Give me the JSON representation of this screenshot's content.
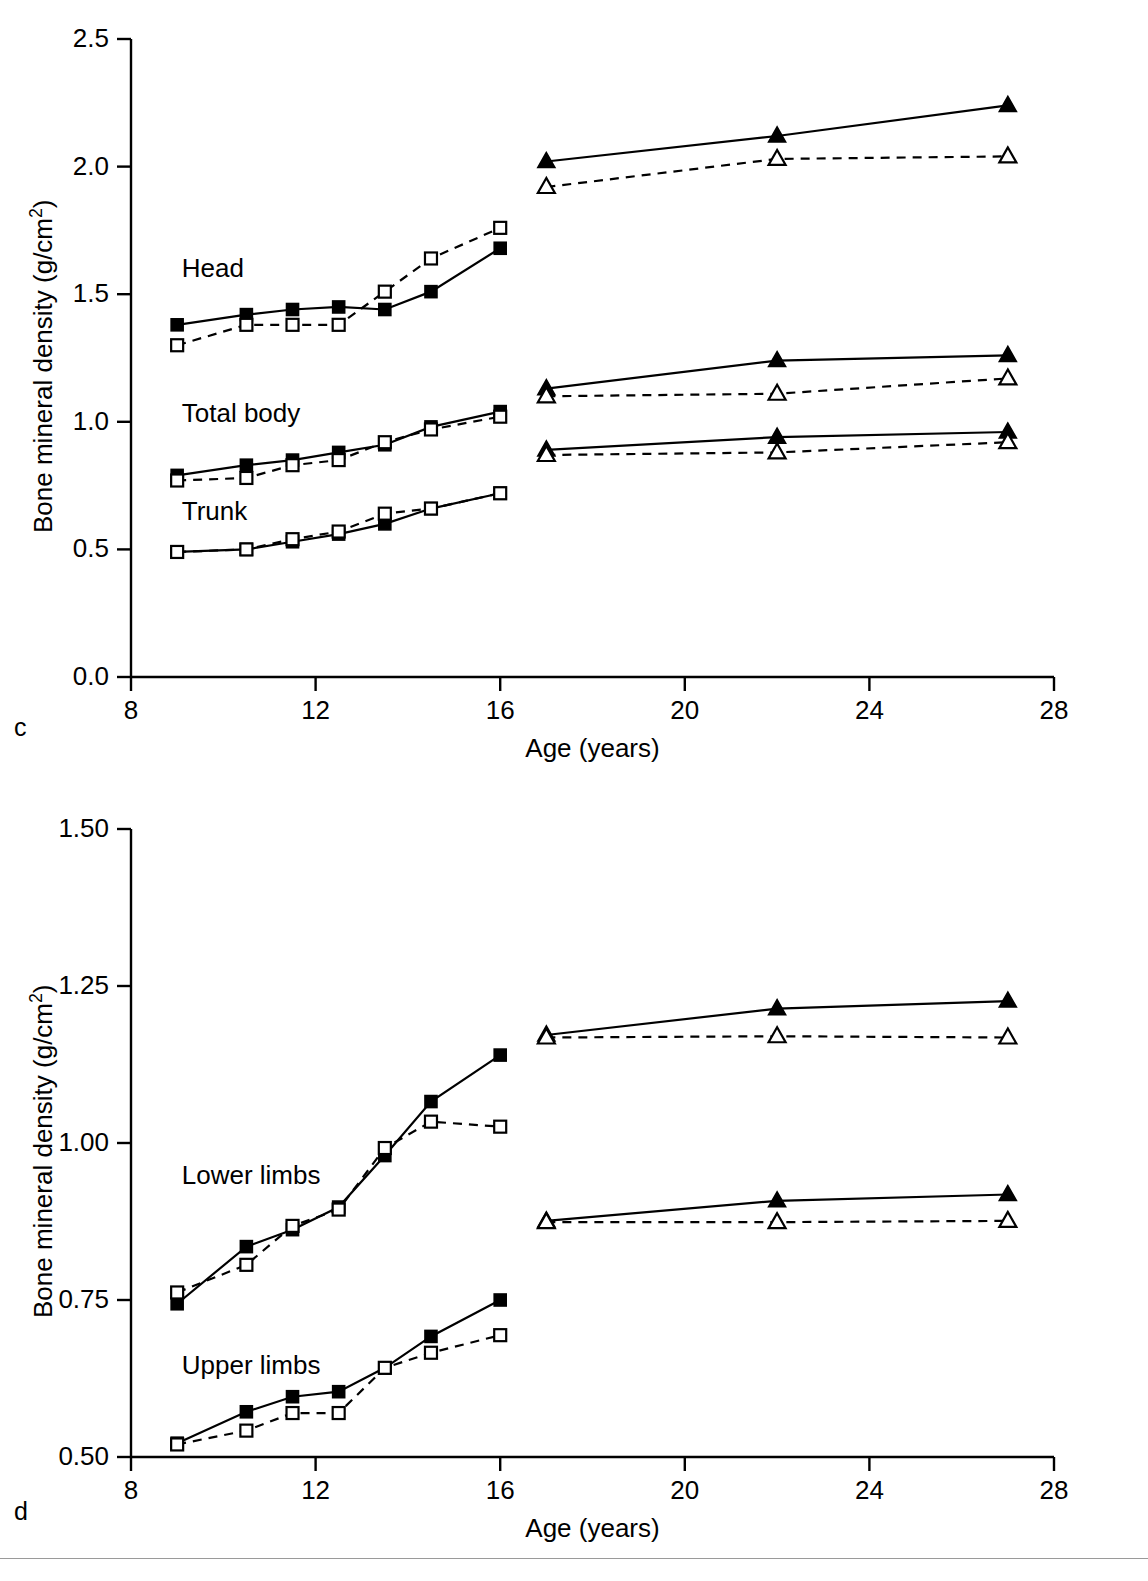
{
  "figure": {
    "panels": [
      {
        "letter": "c"
      },
      {
        "letter": "d"
      }
    ],
    "footer_note": ""
  },
  "panel_c": {
    "letter": "c",
    "xlabel": "Age (years)",
    "ylabel_part1": "Bone mineral density (g/cm",
    "ylabel_sup": "2",
    "ylabel_part3": ")",
    "x_ticks": [
      "8",
      "12",
      "16",
      "20",
      "24",
      "28"
    ],
    "y_ticks": [
      "0.0",
      "0.5",
      "1.0",
      "1.5",
      "2.0",
      "2.5"
    ],
    "series_labels": [
      "Head",
      "Total body",
      "Trunk"
    ]
  },
  "panel_d": {
    "letter": "d",
    "xlabel": "Age (years)",
    "ylabel_part1": "Bone mineral density (g/cm",
    "ylabel_sup": "2",
    "ylabel_part3": ")",
    "x_ticks": [
      "8",
      "12",
      "16",
      "20",
      "24",
      "28"
    ],
    "y_ticks": [
      "0.50",
      "0.75",
      "1.00",
      "1.25",
      "1.50"
    ],
    "series_labels": [
      "Lower limbs",
      "Upper limbs"
    ]
  },
  "chart_data": [
    {
      "id": "panel-c",
      "type": "line",
      "title": "",
      "panel_letter": "c",
      "xlabel": "Age (years)",
      "ylabel": "Bone mineral density (g/cm2)",
      "xlim": [
        8,
        28
      ],
      "ylim": [
        0.0,
        2.5
      ],
      "xticks": [
        8,
        12,
        16,
        20,
        24,
        28
      ],
      "yticks": [
        0.0,
        0.5,
        1.0,
        1.5,
        2.0,
        2.5
      ],
      "grid": false,
      "legend": "none",
      "annotations": [
        "Head",
        "Total body",
        "Trunk"
      ],
      "series": [
        {
          "name": "Head - males (filled square, solid)",
          "region": "Head",
          "group": "males",
          "marker": "filled-square",
          "line": "solid",
          "x": [
            9.0,
            10.5,
            11.5,
            12.5,
            13.5,
            14.5,
            16.0
          ],
          "values": [
            1.38,
            1.42,
            1.44,
            1.45,
            1.44,
            1.51,
            1.68
          ]
        },
        {
          "name": "Head - females (open square, dashed)",
          "region": "Head",
          "group": "females",
          "marker": "open-square",
          "line": "dashed",
          "x": [
            9.0,
            10.5,
            11.5,
            12.5,
            13.5,
            14.5,
            16.0
          ],
          "values": [
            1.3,
            1.38,
            1.38,
            1.38,
            1.51,
            1.64,
            1.76
          ]
        },
        {
          "name": "Head - males adult (filled triangle, solid)",
          "region": "Head",
          "group": "males-adult",
          "marker": "filled-triangle",
          "line": "solid",
          "x": [
            17.0,
            22.0,
            27.0
          ],
          "values": [
            2.02,
            2.12,
            2.24
          ]
        },
        {
          "name": "Head - females adult (open triangle, dashed)",
          "region": "Head",
          "group": "females-adult",
          "marker": "open-triangle",
          "line": "dashed",
          "x": [
            17.0,
            22.0,
            27.0
          ],
          "values": [
            1.92,
            2.03,
            2.04
          ]
        },
        {
          "name": "Total body - males (filled square, solid)",
          "region": "Total body",
          "group": "males",
          "marker": "filled-square",
          "line": "solid",
          "x": [
            9.0,
            10.5,
            11.5,
            12.5,
            13.5,
            14.5,
            16.0
          ],
          "values": [
            0.79,
            0.83,
            0.85,
            0.88,
            0.91,
            0.98,
            1.04
          ]
        },
        {
          "name": "Total body - females (open square, dashed)",
          "region": "Total body",
          "group": "females",
          "marker": "open-square",
          "line": "dashed",
          "x": [
            9.0,
            10.5,
            11.5,
            12.5,
            13.5,
            14.5,
            16.0
          ],
          "values": [
            0.77,
            0.78,
            0.83,
            0.85,
            0.92,
            0.97,
            1.02
          ]
        },
        {
          "name": "Total body - males adult (filled triangle, solid)",
          "region": "Total body",
          "group": "males-adult",
          "marker": "filled-triangle",
          "line": "solid",
          "x": [
            17.0,
            22.0,
            27.0
          ],
          "values": [
            1.13,
            1.24,
            1.26
          ]
        },
        {
          "name": "Total body - females adult (open triangle, dashed)",
          "region": "Total body",
          "group": "females-adult",
          "marker": "open-triangle",
          "line": "dashed",
          "x": [
            17.0,
            22.0,
            27.0
          ],
          "values": [
            1.1,
            1.11,
            1.17
          ]
        },
        {
          "name": "Trunk - males (filled square, solid)",
          "region": "Trunk",
          "group": "males",
          "marker": "filled-square",
          "line": "solid",
          "x": [
            9.0,
            10.5,
            11.5,
            12.5,
            13.5,
            14.5,
            16.0
          ],
          "values": [
            0.49,
            0.5,
            0.53,
            0.56,
            0.6,
            0.66,
            0.72
          ]
        },
        {
          "name": "Trunk - females (open square, dashed)",
          "region": "Trunk",
          "group": "females",
          "marker": "open-square",
          "line": "dashed",
          "x": [
            9.0,
            10.5,
            11.5,
            12.5,
            13.5,
            14.5,
            16.0
          ],
          "values": [
            0.49,
            0.5,
            0.54,
            0.57,
            0.64,
            0.66,
            0.72
          ]
        },
        {
          "name": "Trunk - males adult (filled triangle, solid)",
          "region": "Trunk",
          "group": "males-adult",
          "marker": "filled-triangle",
          "line": "solid",
          "x": [
            17.0,
            22.0,
            27.0
          ],
          "values": [
            0.89,
            0.94,
            0.96
          ]
        },
        {
          "name": "Trunk - females adult (open triangle, dashed)",
          "region": "Trunk",
          "group": "females-adult",
          "marker": "open-triangle",
          "line": "dashed",
          "x": [
            17.0,
            22.0,
            27.0
          ],
          "values": [
            0.87,
            0.88,
            0.92
          ]
        }
      ]
    },
    {
      "id": "panel-d",
      "type": "line",
      "title": "",
      "panel_letter": "d",
      "xlabel": "Age (years)",
      "ylabel": "Bone mineral density (g/cm2)",
      "xlim": [
        8,
        28
      ],
      "ylim": [
        0.5,
        1.5
      ],
      "xticks": [
        8,
        12,
        16,
        20,
        24,
        28
      ],
      "yticks": [
        0.5,
        0.75,
        1.0,
        1.25,
        1.5
      ],
      "grid": false,
      "legend": "none",
      "annotations": [
        "Lower limbs",
        "Upper limbs"
      ],
      "series": [
        {
          "name": "Lower limbs - males (filled square, solid)",
          "region": "Lower limbs",
          "group": "males",
          "marker": "filled-square",
          "line": "solid",
          "x": [
            9.0,
            10.5,
            11.5,
            12.5,
            13.5,
            14.5,
            16.0
          ],
          "values": [
            0.744,
            0.835,
            0.862,
            0.898,
            0.98,
            1.066,
            1.14
          ]
        },
        {
          "name": "Lower limbs - females (open square, dashed)",
          "region": "Lower limbs",
          "group": "females",
          "marker": "open-square",
          "line": "dashed",
          "x": [
            9.0,
            10.5,
            11.5,
            12.5,
            13.5,
            14.5,
            16.0
          ],
          "values": [
            0.762,
            0.806,
            0.868,
            0.894,
            0.992,
            1.034,
            1.026
          ]
        },
        {
          "name": "Lower limbs - males adult (filled triangle, solid)",
          "region": "Lower limbs",
          "group": "males-adult",
          "marker": "filled-triangle",
          "line": "solid",
          "x": [
            17.0,
            22.0,
            27.0
          ],
          "values": [
            1.172,
            1.214,
            1.226
          ]
        },
        {
          "name": "Lower limbs - females adult (open triangle, dashed)",
          "region": "Lower limbs",
          "group": "females-adult",
          "marker": "open-triangle",
          "line": "dashed",
          "x": [
            17.0,
            22.0,
            27.0
          ],
          "values": [
            1.168,
            1.17,
            1.168
          ]
        },
        {
          "name": "Upper limbs - males (filled square, solid)",
          "region": "Upper limbs",
          "group": "males",
          "marker": "filled-square",
          "line": "solid",
          "x": [
            9.0,
            10.5,
            11.5,
            12.5,
            13.5,
            14.5,
            16.0
          ],
          "values": [
            0.522,
            0.572,
            0.596,
            0.604,
            0.642,
            0.692,
            0.75
          ]
        },
        {
          "name": "Upper limbs - females (open square, dashed)",
          "region": "Upper limbs",
          "group": "females",
          "marker": "open-square",
          "line": "dashed",
          "x": [
            9.0,
            10.5,
            11.5,
            12.5,
            13.5,
            14.5,
            16.0
          ],
          "values": [
            0.52,
            0.542,
            0.57,
            0.57,
            0.642,
            0.666,
            0.694
          ]
        },
        {
          "name": "Upper limbs - males adult (filled triangle, solid)",
          "region": "Upper limbs",
          "group": "males-adult",
          "marker": "filled-triangle",
          "line": "solid",
          "x": [
            17.0,
            22.0,
            27.0
          ],
          "values": [
            0.876,
            0.908,
            0.918
          ]
        },
        {
          "name": "Upper limbs - females adult (open triangle, dashed)",
          "region": "Upper limbs",
          "group": "females-adult",
          "marker": "open-triangle",
          "line": "dashed",
          "x": [
            17.0,
            22.0,
            27.0
          ],
          "values": [
            0.874,
            0.874,
            0.876
          ]
        }
      ]
    }
  ]
}
